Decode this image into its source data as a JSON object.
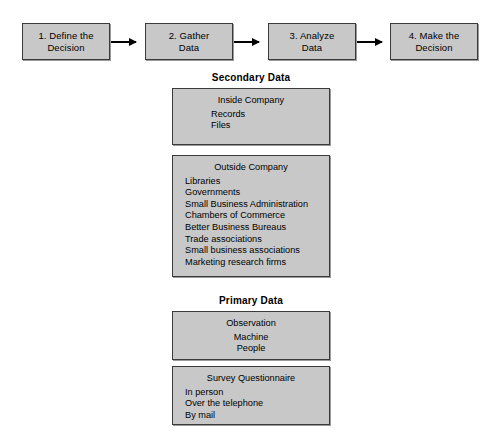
{
  "flow": {
    "steps": [
      {
        "line1": "1. Define the",
        "line2": "Decision"
      },
      {
        "line1": "2. Gather",
        "line2": "Data"
      },
      {
        "line1": "3. Analyze",
        "line2": "Data"
      },
      {
        "line1": "4. Make the",
        "line2": "Decision"
      }
    ],
    "arrow_icon": "arrow-right-icon"
  },
  "sections": [
    {
      "title": "Secondary Data",
      "boxes": [
        {
          "head": "Inside Company",
          "items": [
            "Records",
            "Files"
          ]
        },
        {
          "head": "Outside Company",
          "items": [
            "Libraries",
            "Governments",
            "Small Business Administration",
            "Chambers of Commerce",
            "Better Business Bureaus",
            "Trade associations",
            "Small business associations",
            "Marketing research firms"
          ]
        }
      ]
    },
    {
      "title": "Primary Data",
      "boxes": [
        {
          "head": "Observation",
          "items": [
            "Machine",
            "People"
          ]
        },
        {
          "head": "Survey Questionnaire",
          "items": [
            "In person",
            "Over the telephone",
            "By mail"
          ]
        }
      ]
    }
  ],
  "colors": {
    "box_fill": "#c8c8c8",
    "box_border": "#3a3a3a",
    "text": "#000000",
    "background": "#ffffff"
  }
}
